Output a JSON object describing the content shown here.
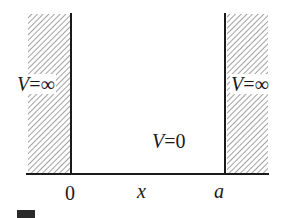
{
  "diagram": {
    "regions": {
      "left_wall": {
        "potential_label": {
          "var": "V",
          "eq": "=",
          "val": "∞"
        }
      },
      "well": {
        "potential_label": {
          "var": "V",
          "eq": "=",
          "val": "0"
        }
      },
      "right_wall": {
        "potential_label": {
          "var": "V",
          "eq": "=",
          "val": "∞"
        }
      }
    },
    "axis": {
      "ticks": [
        {
          "label": "0",
          "position": "left-wall"
        },
        {
          "label": "x",
          "position": "middle"
        },
        {
          "label": "a",
          "position": "right-wall"
        }
      ]
    },
    "colors": {
      "line": "#1a1a1a",
      "hatch": "#8a8a8a",
      "background": "#ffffff"
    }
  }
}
